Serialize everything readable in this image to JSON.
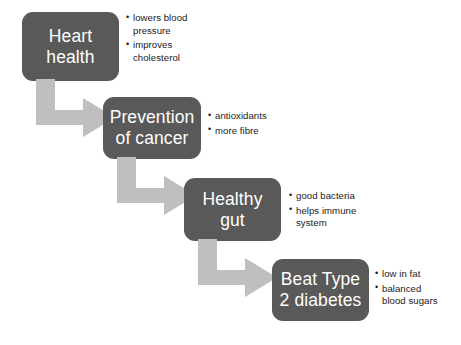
{
  "diagram": {
    "colors": {
      "node_fill": "#595959",
      "node_text": "#ffffff",
      "arrow_fill": "#bfbfbf",
      "bullet_text": "#1a1a1a",
      "background": "#ffffff"
    },
    "nodes": [
      {
        "id": "heart-health",
        "label": "Heart\nhealth",
        "bullets": [
          "lowers blood\npressure",
          "improves\ncholesterol"
        ]
      },
      {
        "id": "prevention-of-cancer",
        "label": "Prevention\nof cancer",
        "bullets": [
          "antioxidants",
          "more fibre"
        ]
      },
      {
        "id": "healthy-gut",
        "label": "Healthy\ngut",
        "bullets": [
          "good bacteria",
          "helps immune\nsystem"
        ]
      },
      {
        "id": "beat-type-2-diabetes",
        "label": "Beat Type\n2 diabetes",
        "bullets": [
          "low in fat",
          "balanced\nblood sugars"
        ]
      }
    ],
    "arrows": [
      {
        "id": "arrow-heart-to-cancer",
        "from": "heart-health",
        "to": "prevention-of-cancer",
        "shape": "elbow-down-right"
      },
      {
        "id": "arrow-cancer-to-gut",
        "from": "prevention-of-cancer",
        "to": "healthy-gut",
        "shape": "elbow-down-right"
      },
      {
        "id": "arrow-gut-to-diabetes",
        "from": "healthy-gut",
        "to": "beat-type-2-diabetes",
        "shape": "elbow-down-right"
      }
    ]
  }
}
